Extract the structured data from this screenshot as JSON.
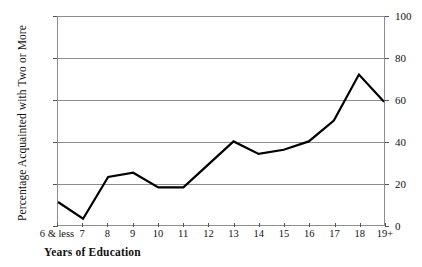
{
  "chart_data": {
    "type": "line",
    "title": "",
    "xlabel": "Years of  Education",
    "ylabel": "Percentage Acquainted with Two or More",
    "categories": [
      "6 & less",
      "7",
      "8",
      "9",
      "10",
      "11",
      "12",
      "13",
      "14",
      "15",
      "16",
      "17",
      "18",
      "19+"
    ],
    "values": [
      11,
      3,
      23,
      25,
      18,
      18,
      29,
      40,
      34,
      36,
      40,
      50,
      72,
      59
    ],
    "ylim": [
      0,
      100
    ],
    "yticks": [
      0,
      20,
      40,
      60,
      80,
      100
    ],
    "ytick_labels_left": [
      "0",
      "20",
      "40",
      "60",
      "80",
      "100"
    ],
    "ytick_labels_right": [
      "0",
      "20",
      "40",
      "60",
      "80",
      "100"
    ],
    "grid": true,
    "legend": "none",
    "line_color": "#000000",
    "grid_color": "#8d8d8d",
    "background_color": "#ffffff",
    "dual_axis": true
  }
}
